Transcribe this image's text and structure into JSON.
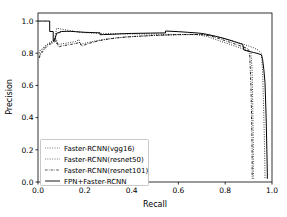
{
  "chart_data": {
    "type": "line",
    "title": "",
    "xlabel": "Recall",
    "ylabel": "Precision",
    "xlim": [
      0.0,
      1.0
    ],
    "ylim": [
      0.0,
      1.05
    ],
    "xticks": [
      "0.0",
      "0.2",
      "0.4",
      "0.6",
      "0.8",
      "1.0"
    ],
    "xtick_values": [
      0.0,
      0.2,
      0.4,
      0.6,
      0.8,
      1.0
    ],
    "yticks": [
      "0.0",
      "0.2",
      "0.4",
      "0.6",
      "0.8",
      "1.0"
    ],
    "ytick_values": [
      0.0,
      0.2,
      0.4,
      0.6,
      0.8,
      1.0
    ],
    "grid": false,
    "legend_position": "lower left",
    "colors": {
      "line": "#000000",
      "axis": "#000000",
      "legend_border": "#b0b0b0",
      "background": "#ffffff"
    },
    "series": [
      {
        "name": "Faster-RCNN(vgg16)",
        "style": "dotted",
        "x": [
          0.005,
          0.01,
          0.02,
          0.03,
          0.04,
          0.05,
          0.06,
          0.07,
          0.08,
          0.1,
          0.12,
          0.14,
          0.16,
          0.18,
          0.2,
          0.24,
          0.28,
          0.32,
          0.36,
          0.4,
          0.44,
          0.48,
          0.52,
          0.56,
          0.6,
          0.64,
          0.68,
          0.72,
          0.76,
          0.8,
          0.84,
          0.86,
          0.88,
          0.9,
          0.91,
          0.915,
          0.918,
          0.92,
          0.92,
          0.92
        ],
        "y": [
          0.78,
          0.8,
          0.82,
          0.84,
          0.855,
          0.865,
          0.875,
          0.885,
          0.955,
          0.95,
          0.945,
          0.94,
          0.935,
          0.93,
          0.928,
          0.925,
          0.923,
          0.922,
          0.921,
          0.92,
          0.92,
          0.919,
          0.918,
          0.917,
          0.917,
          0.916,
          0.915,
          0.905,
          0.885,
          0.865,
          0.845,
          0.835,
          0.825,
          0.815,
          0.8,
          0.7,
          0.45,
          0.25,
          0.1,
          0.02
        ]
      },
      {
        "name": "Faster-RCNN(resnet50)",
        "style": "dotted",
        "x": [
          0.005,
          0.01,
          0.02,
          0.03,
          0.04,
          0.05,
          0.06,
          0.07,
          0.075,
          0.08,
          0.09,
          0.1,
          0.12,
          0.14,
          0.16,
          0.175,
          0.18,
          0.2,
          0.24,
          0.28,
          0.32,
          0.36,
          0.4,
          0.44,
          0.48,
          0.52,
          0.56,
          0.6,
          0.64,
          0.68,
          0.72,
          0.76,
          0.8,
          0.84,
          0.88,
          0.9,
          0.92,
          0.94,
          0.955,
          0.96,
          0.965,
          0.968,
          0.97,
          0.97
        ],
        "y": [
          0.8,
          0.82,
          0.83,
          0.845,
          0.855,
          0.862,
          0.868,
          0.875,
          0.895,
          0.86,
          0.855,
          0.858,
          0.862,
          0.868,
          0.872,
          0.885,
          0.855,
          0.862,
          0.875,
          0.885,
          0.893,
          0.899,
          0.903,
          0.906,
          0.909,
          0.911,
          0.913,
          0.915,
          0.916,
          0.917,
          0.915,
          0.905,
          0.89,
          0.872,
          0.855,
          0.845,
          0.835,
          0.82,
          0.8,
          0.68,
          0.42,
          0.22,
          0.08,
          0.02
        ]
      },
      {
        "name": "Faster-RCNN(resnet101)",
        "style": "dashdot",
        "x": [
          0.005,
          0.01,
          0.02,
          0.03,
          0.04,
          0.05,
          0.06,
          0.07,
          0.08,
          0.085,
          0.09,
          0.1,
          0.12,
          0.14,
          0.16,
          0.18,
          0.185,
          0.19,
          0.2,
          0.22,
          0.26,
          0.3,
          0.34,
          0.38,
          0.42,
          0.46,
          0.5,
          0.54,
          0.58,
          0.62,
          0.66,
          0.7,
          0.74,
          0.78,
          0.82,
          0.86,
          0.88,
          0.9,
          0.905,
          0.91,
          0.913,
          0.915,
          0.915,
          0.915
        ],
        "y": [
          0.77,
          0.79,
          0.81,
          0.83,
          0.845,
          0.855,
          0.862,
          0.87,
          0.882,
          0.845,
          0.84,
          0.845,
          0.85,
          0.855,
          0.86,
          0.868,
          0.848,
          0.845,
          0.852,
          0.862,
          0.878,
          0.888,
          0.896,
          0.901,
          0.905,
          0.908,
          0.911,
          0.913,
          0.915,
          0.916,
          0.917,
          0.916,
          0.906,
          0.888,
          0.868,
          0.848,
          0.838,
          0.825,
          0.78,
          0.6,
          0.38,
          0.18,
          0.06,
          0.02
        ]
      },
      {
        "name": "FPN+Faster-RCNN",
        "style": "solid",
        "x": [
          0.0,
          0.02,
          0.04,
          0.05,
          0.05,
          0.06,
          0.065,
          0.065,
          0.07,
          0.08,
          0.09,
          0.095,
          0.095,
          0.1,
          0.12,
          0.14,
          0.16,
          0.18,
          0.2,
          0.22,
          0.24,
          0.26,
          0.265,
          0.265,
          0.28,
          0.32,
          0.36,
          0.4,
          0.44,
          0.48,
          0.52,
          0.545,
          0.545,
          0.56,
          0.6,
          0.64,
          0.68,
          0.7,
          0.72,
          0.76,
          0.8,
          0.84,
          0.86,
          0.875,
          0.88,
          0.9,
          0.92,
          0.94,
          0.955,
          0.96,
          0.965,
          0.97,
          0.975,
          0.978,
          0.98,
          0.98
        ],
        "y": [
          1.0,
          1.0,
          1.0,
          1.0,
          0.935,
          0.935,
          0.935,
          0.875,
          0.878,
          0.925,
          0.928,
          0.928,
          0.935,
          0.935,
          0.936,
          0.936,
          0.934,
          0.932,
          0.93,
          0.929,
          0.928,
          0.927,
          0.927,
          0.915,
          0.916,
          0.918,
          0.921,
          0.923,
          0.924,
          0.925,
          0.926,
          0.926,
          0.938,
          0.937,
          0.934,
          0.93,
          0.926,
          0.923,
          0.918,
          0.905,
          0.89,
          0.872,
          0.862,
          0.855,
          0.82,
          0.812,
          0.805,
          0.798,
          0.79,
          0.76,
          0.7,
          0.62,
          0.4,
          0.2,
          0.06,
          0.02
        ]
      }
    ]
  },
  "legend": {
    "entries": [
      {
        "label": "Faster-RCNN(vgg16)"
      },
      {
        "label": "Faster-RCNN(resnet50)"
      },
      {
        "label": "Faster-RCNN(resnet101)"
      },
      {
        "label": "FPN+Faster-RCNN"
      }
    ]
  }
}
